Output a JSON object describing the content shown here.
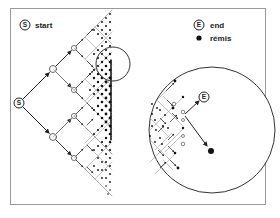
{
  "figure": {
    "type": "branching-path-diagram",
    "legend": {
      "start": {
        "symbol": "S",
        "label": "start"
      },
      "end": {
        "symbol": "E",
        "label": "end"
      },
      "remis": {
        "symbol": "filled-dot",
        "label": "rémis"
      }
    },
    "left_panel": {
      "start_node_label": "S",
      "description": "Binary tree branching from S rightward, fanning into a dense column of endpoints; small magnifier circle highlights a region"
    },
    "right_panel": {
      "end_node_label": "E",
      "description": "Enlarged circular view of the highlighted region showing branches leading to E and a rémis dot"
    }
  },
  "colors": {
    "line": "#222222",
    "tree_line": "#888888",
    "frame": "#9a9a9a",
    "background": "#ffffff"
  }
}
